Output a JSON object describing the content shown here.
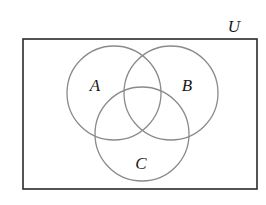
{
  "diagram": {
    "type": "venn-diagram",
    "universe": {
      "label": "U",
      "rect": {
        "x": 23,
        "y": 39,
        "width": 234,
        "height": 150
      }
    },
    "sets": [
      {
        "label": "A",
        "cx": 114,
        "cy": 93,
        "r": 47,
        "label_x": 95,
        "label_y": 91
      },
      {
        "label": "B",
        "cx": 171,
        "cy": 93,
        "r": 47,
        "label_x": 187,
        "label_y": 91
      },
      {
        "label": "C",
        "cx": 142,
        "cy": 134,
        "r": 47,
        "label_x": 141,
        "label_y": 169
      }
    ],
    "colors": {
      "background": "#ffffff",
      "rectangle_stroke": "#2a2a2a",
      "circle_stroke": "#8a8a8a",
      "text": "#1a1a1a"
    }
  }
}
